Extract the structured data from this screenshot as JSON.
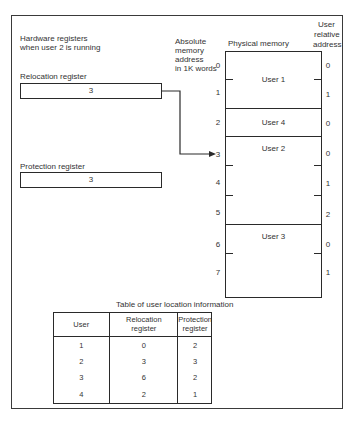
{
  "registers": {
    "heading_line1": "Hardware registers",
    "heading_line2": "when user 2 is running",
    "relocation": {
      "label": "Relocation register",
      "value": "3"
    },
    "protection": {
      "label": "Protection register",
      "value": "3"
    }
  },
  "memory": {
    "abs_heading_line1": "Absolute",
    "abs_heading_line2": "memory",
    "abs_heading_line3": "address",
    "abs_heading_line4": "in 1K words",
    "phys_heading": "Physical memory",
    "rel_heading_line1": "User",
    "rel_heading_line2": "relative",
    "rel_heading_line3": "address",
    "absolute_addresses": [
      "0",
      "1",
      "2",
      "3",
      "4",
      "5",
      "6",
      "7"
    ],
    "relative_addresses": [
      "0",
      "1",
      "0",
      "0",
      "1",
      "2",
      "0",
      "1"
    ],
    "segments": [
      {
        "label": "User 1",
        "start": 0,
        "size": 2
      },
      {
        "label": "User 4",
        "start": 2,
        "size": 1
      },
      {
        "label": "User 2",
        "start": 3,
        "size": 3
      },
      {
        "label": "User 3",
        "start": 6,
        "size": 2
      }
    ]
  },
  "table": {
    "title": "Table of user location information",
    "headers": {
      "user": "User",
      "reloc_line1": "Relocation",
      "reloc_line2": "register",
      "prot_line1": "Protection",
      "prot_line2": "register"
    },
    "rows": [
      {
        "user": "1",
        "relocation": "0",
        "protection": "2"
      },
      {
        "user": "2",
        "relocation": "3",
        "protection": "3"
      },
      {
        "user": "3",
        "relocation": "6",
        "protection": "2"
      },
      {
        "user": "4",
        "relocation": "2",
        "protection": "1"
      }
    ]
  }
}
